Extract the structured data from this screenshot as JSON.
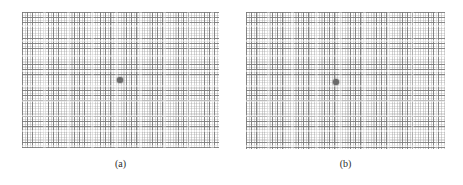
{
  "figure": {
    "caption_style": "subpanel-letters",
    "background_color": "#ffffff",
    "grid_line_color": "#787878",
    "dot_color": "#6b6b6b",
    "label_color": "#2b2b2b",
    "panels": [
      {
        "id": "panel-a",
        "label": "(a)",
        "x": 22,
        "y": 12,
        "width": 197,
        "height": 136,
        "grid_cell_px": 5.2,
        "dot": {
          "name": "fixation-dot",
          "cx": 120,
          "cy": 80,
          "diameter": 6
        },
        "label_x": 22,
        "label_y": 158
      },
      {
        "id": "panel-b",
        "label": "(b)",
        "x": 246,
        "y": 12,
        "width": 199,
        "height": 137,
        "grid_cell_px": 5.2,
        "dot": {
          "name": "fixation-dot",
          "cx": 336,
          "cy": 82,
          "diameter": 6
        },
        "label_x": 246,
        "label_y": 158
      }
    ]
  },
  "chart_data": {
    "type": "scatter",
    "title": "",
    "xlabel": "",
    "ylabel": "",
    "grid": true,
    "legend": "none",
    "panels": [
      {
        "label": "(a)",
        "grid_columns": 38,
        "grid_rows": 26,
        "cell_size_px": 5.2,
        "points": [
          {
            "name": "fixation-dot",
            "x": 0.5,
            "y": 0.5
          }
        ],
        "xlim": [
          0,
          1
        ],
        "ylim": [
          0,
          1
        ]
      },
      {
        "label": "(b)",
        "grid_columns": 38,
        "grid_rows": 26,
        "cell_size_px": 5.2,
        "points": [
          {
            "name": "fixation-dot",
            "x": 0.452,
            "y": 0.511
          }
        ],
        "xlim": [
          0,
          1
        ],
        "ylim": [
          0,
          1
        ]
      }
    ]
  }
}
